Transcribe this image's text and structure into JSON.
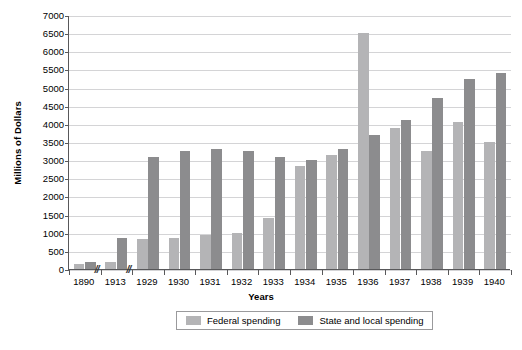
{
  "chart_data": {
    "type": "bar",
    "title": "",
    "xlabel": "Years",
    "ylabel": "Millions of Dollars",
    "ylim": [
      0,
      7000
    ],
    "ytick_step": 500,
    "grid": true,
    "legend_position": "bottom-center",
    "axis_breaks_after": [
      "1890",
      "1913"
    ],
    "categories": [
      "1890",
      "1913",
      "1929",
      "1930",
      "1931",
      "1932",
      "1933",
      "1934",
      "1935",
      "1936",
      "1937",
      "1938",
      "1939",
      "1940"
    ],
    "series": [
      {
        "name": "Federal spending",
        "color": "#b4b4b6",
        "values": [
          125,
          200,
          820,
          850,
          950,
          1000,
          1400,
          2850,
          3150,
          6500,
          3900,
          3250,
          4050,
          3500
        ]
      },
      {
        "name": "State and local spending",
        "color": "#8c8c8e",
        "values": [
          200,
          850,
          3100,
          3250,
          3300,
          3250,
          3100,
          3000,
          3300,
          3700,
          4100,
          4700,
          5250,
          5400
        ]
      }
    ],
    "ytick_labels": [
      "7000",
      "6500",
      "6000",
      "5500",
      "5000",
      "4500",
      "4000",
      "3500",
      "3000",
      "2500",
      "2000",
      "1500",
      "1000",
      "500",
      "0"
    ],
    "axis_break_glyph": "//"
  },
  "axes": {
    "y_title": "Millions of Dollars",
    "x_title": "Years"
  },
  "legend": {
    "items": [
      {
        "label": "Federal spending",
        "color": "#b4b4b6"
      },
      {
        "label": "State and local spending",
        "color": "#8c8c8e"
      }
    ]
  }
}
